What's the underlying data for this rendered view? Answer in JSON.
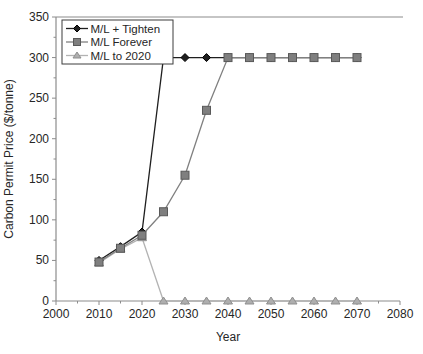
{
  "chart_data": {
    "type": "line",
    "title": "",
    "xlabel": "Year",
    "ylabel": "Carbon Permit Price ($/tonne)",
    "xlim": [
      2000,
      2080
    ],
    "ylim": [
      0,
      350
    ],
    "x_ticks": [
      2000,
      2010,
      2020,
      2030,
      2040,
      2050,
      2060,
      2070,
      2080
    ],
    "y_ticks": [
      0,
      50,
      100,
      150,
      200,
      250,
      300,
      350
    ],
    "x_tick_step": 10,
    "x_minor_tick_step": 5,
    "y_tick_step": 50,
    "y_minor_tick_step": 25,
    "grid": false,
    "legend_position": "top-left",
    "x": [
      2010,
      2015,
      2020,
      2025,
      2030,
      2035,
      2040,
      2045,
      2050,
      2055,
      2060,
      2065,
      2070
    ],
    "series": [
      {
        "name": "M/L + Tighten",
        "marker": "diamond",
        "line_color": "#1f1f1f",
        "marker_fill": "#1f1f1f",
        "marker_edge": "#000000",
        "values": [
          50,
          67,
          85,
          300,
          300,
          300,
          300,
          300,
          300,
          300,
          300,
          300,
          300
        ]
      },
      {
        "name": "M/L Forever",
        "marker": "square",
        "line_color": "#808080",
        "marker_fill": "#7f7f7f",
        "marker_edge": "#595959",
        "values": [
          48,
          65,
          81,
          110,
          155,
          235,
          300,
          300,
          300,
          300,
          300,
          300,
          300
        ]
      },
      {
        "name": "M/L to 2020",
        "marker": "triangle",
        "line_color": "#b3b3b3",
        "marker_fill": "#aeaeae",
        "marker_edge": "#8f8f8f",
        "values": [
          47,
          64,
          78,
          0,
          0,
          0,
          0,
          0,
          0,
          0,
          0,
          0,
          0
        ]
      }
    ],
    "colors": {
      "axis": "#8c8c8c",
      "text": "#262626",
      "background": "#ffffff",
      "legend_border": "#3c3c3c"
    }
  }
}
